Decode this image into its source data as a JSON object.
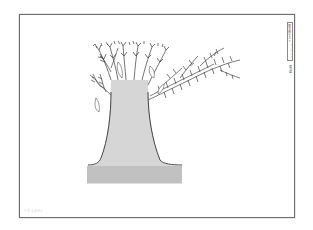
{
  "page": {
    "frame_color": "#6f6f6f",
    "side_label": {
      "title": "樹木画テスト",
      "subtitle": "ワークシート"
    },
    "page_number": "第1図",
    "footer_caption": "バウムテスト"
  },
  "illustration": {
    "subject": "tree",
    "description": "Pen-and-ink drawing of a large tree trunk with horizontal hatching, branches spreading to the upper right, standing on hatched ground",
    "line_color": "#444444"
  }
}
